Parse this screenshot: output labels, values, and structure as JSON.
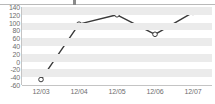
{
  "chart_data": {
    "type": "line",
    "title": "",
    "subtitle": "",
    "xlabel": "",
    "ylabel": "",
    "categories": [
      "12/03",
      "12/04",
      "12/05",
      "12/06",
      "12/07"
    ],
    "values": [
      -46,
      96,
      120,
      70,
      126
    ],
    "series": [
      {
        "name": "series-1",
        "values": [
          -46,
          96,
          120,
          70,
          126
        ]
      }
    ],
    "ylim": [
      -60,
      140
    ],
    "ytick_labels": [
      "140",
      "120",
      "100",
      "80",
      "60",
      "40",
      "20",
      "0",
      "-20",
      "-40",
      "-60"
    ],
    "ytick_values": [
      140,
      120,
      100,
      80,
      60,
      40,
      20,
      0,
      -20,
      -40,
      -60
    ],
    "grid": true,
    "grid_style": "horizontal-banded",
    "legend": false,
    "legend_position": "none",
    "marker": "circle-open",
    "colors": {
      "line": "#3a3a3a",
      "marker_fill": "#ffffff",
      "marker_stroke": "#3a3a3a",
      "band": "#ebebeb",
      "plot_background": "#ffffff",
      "axis": "#c4c4c4",
      "tick_label": "#6e6e6e"
    }
  }
}
